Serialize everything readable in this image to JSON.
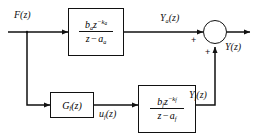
{
  "diagram": {
    "input_label": "F(z)",
    "output_label": "Y(z)",
    "top_path_output_label": "Y",
    "top_path_output_sub": "a",
    "top_path_output_tail": "(z)",
    "bottom_path_output_label": "Y",
    "bottom_path_output_sub": "f",
    "bottom_path_output_tail": "(z)",
    "control_signal_label": "u",
    "control_signal_sub": "f",
    "control_signal_tail": "(z)",
    "sum_sign_left": "+",
    "sum_sign_bottom": "+",
    "line_color": "#111111"
  },
  "blocks": {
    "primary_plant": {
      "name": "primary-plant",
      "numerator": {
        "coef": "b",
        "coef_sub": "a",
        "var": "z",
        "exp": "−k",
        "exp_sub": "a"
      },
      "denominator": {
        "var": "z",
        "op": "−",
        "pole": "a",
        "pole_sub": "a"
      }
    },
    "controller": {
      "name": "controller",
      "label": "G",
      "label_sub": "f",
      "label_tail": "(z)"
    },
    "secondary_plant": {
      "name": "secondary-plant",
      "numerator": {
        "coef": "b",
        "coef_sub": "f",
        "var": "z",
        "exp": "−k",
        "exp_sub": "f"
      },
      "denominator": {
        "var": "z",
        "op": "−",
        "pole": "a",
        "pole_sub": "f"
      }
    }
  }
}
